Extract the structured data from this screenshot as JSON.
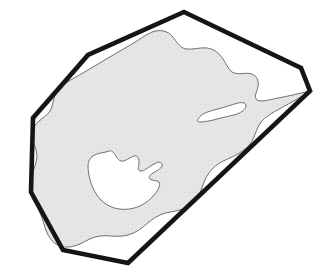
{
  "figure": {
    "description": "A thick black irregular octagonal outline encloses a light gray amoeba-shaped area. The gray area has two white interior holes: a large angular notch-shaped hole in the lower left-center and a small crescent sliver in the upper right. The gray area protrudes slightly beyond the polygon boundary on the right side.",
    "canvas": {
      "width": 326,
      "height": 276,
      "background_color": "#FFFFFF"
    },
    "elements": [
      {
        "name": "outer-polygon",
        "role": "boundary",
        "stroke_color": "#151515",
        "stroke_width": 4.6,
        "fill_color": "none",
        "vertex_count": 8,
        "vertices": [
          [
            184,
            12
          ],
          [
            301,
            68
          ],
          [
            310,
            91
          ],
          [
            128,
            263
          ],
          [
            63,
            250
          ],
          [
            31,
            192
          ],
          [
            33,
            118
          ],
          [
            88,
            55
          ]
        ]
      },
      {
        "name": "shaded-region",
        "role": "region",
        "fill_color": "#E4E4E4",
        "stroke_color": "#6E6E6E",
        "stroke_width": 1.0,
        "hole_count": 2
      },
      {
        "name": "region-hole-large",
        "role": "hole",
        "fill_color": "#FFFFFF",
        "stroke_color": "#6E6E6E",
        "stroke_width": 1.0,
        "approx_center": [
          103,
          172
        ],
        "approx_size": [
          59,
          45
        ]
      },
      {
        "name": "region-hole-sliver",
        "role": "hole",
        "fill_color": "#FFFFFF",
        "stroke_color": "#6E6E6E",
        "stroke_width": 1.0,
        "approx_center": [
          221,
          108
        ],
        "approx_size": [
          49,
          22
        ]
      }
    ],
    "colors": {
      "boundary_stroke": "#151515",
      "region_fill": "#E4E4E4",
      "region_stroke": "#6E6E6E",
      "hole_fill": "#FFFFFF",
      "background": "#FFFFFF"
    }
  }
}
